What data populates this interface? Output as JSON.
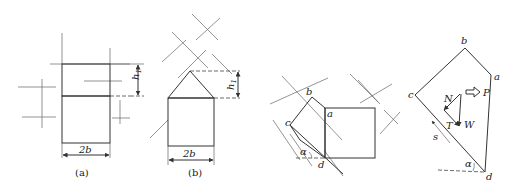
{
  "figure_a": {
    "caption": "(a)",
    "width_label": "2b",
    "height_label": "h",
    "height_subscript": "1"
  },
  "figure_b": {
    "caption": "(b)",
    "width_label": "2b",
    "height_label": "h",
    "height_subscript": "1"
  },
  "figure_c": {
    "vertex_labels": {
      "a": "a",
      "b": "b",
      "c": "c",
      "d": "d"
    },
    "angle_label": "α"
  },
  "figure_d": {
    "vertex_labels": {
      "a": "a",
      "b": "b",
      "c": "c",
      "d": "d"
    },
    "force_labels": {
      "N": "N",
      "P": "P",
      "T": "T",
      "W": "W"
    },
    "slope_label": "s",
    "angle_label": "α"
  }
}
